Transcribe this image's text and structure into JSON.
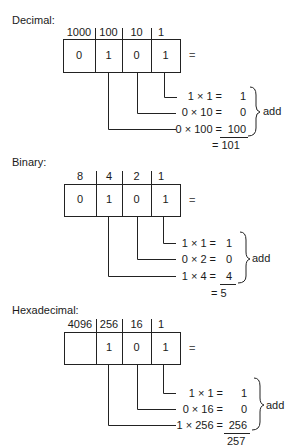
{
  "diagrams": [
    {
      "id": "decimal",
      "title": "Decimal:",
      "place_values": [
        "1000",
        "100",
        "10",
        "1"
      ],
      "digits": [
        "0",
        "1",
        "0",
        "1"
      ],
      "equals": "=",
      "products": [
        {
          "lhs": "1 × 1 =",
          "rhs": "1"
        },
        {
          "lhs": "0 × 10 =",
          "rhs": "0"
        },
        {
          "lhs": "0 × 100 =",
          "rhs": "100"
        }
      ],
      "add_label": "add",
      "total": "= 101"
    },
    {
      "id": "binary",
      "title": "Binary:",
      "place_values": [
        "8",
        "4",
        "2",
        "1"
      ],
      "digits": [
        "0",
        "1",
        "0",
        "1"
      ],
      "equals": "=",
      "products": [
        {
          "lhs": "1 × 1 =",
          "rhs": "1"
        },
        {
          "lhs": "0 × 2 =",
          "rhs": "0"
        },
        {
          "lhs": "1 × 4 =",
          "rhs": "4"
        }
      ],
      "add_label": "add",
      "total": "= 5"
    },
    {
      "id": "hexadecimal",
      "title": "Hexadecimal:",
      "place_values": [
        "4096",
        "256",
        "16",
        "1"
      ],
      "digits": [
        "",
        "1",
        "0",
        "1"
      ],
      "equals": "=",
      "products": [
        {
          "lhs": "1 × 1 =",
          "rhs": "1"
        },
        {
          "lhs": "0 × 16 =",
          "rhs": "0"
        },
        {
          "lhs": "1 × 256 =",
          "rhs": "256"
        }
      ],
      "add_label": "add",
      "total": "257"
    }
  ]
}
